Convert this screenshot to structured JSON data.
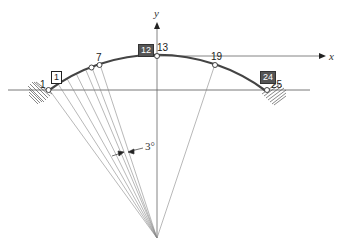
{
  "diagram": {
    "axes": {
      "x_label": "x",
      "y_label": "y"
    },
    "node_labels": {
      "n1": "1",
      "n7": "7",
      "n13": "13",
      "n19": "19",
      "n25": "25"
    },
    "element_labels": {
      "e1": "1",
      "e12": "12",
      "e24": "24"
    },
    "angle_label": "3°",
    "colors": {
      "line": "#333333",
      "arc": "#444444",
      "fan": "#888888",
      "hatch": "#555555",
      "node_fill": "#ffffff"
    },
    "geometry": {
      "center": [
        157,
        238
      ],
      "radius": 182,
      "half_angle_deg": 36,
      "element_angle_deg": 3,
      "num_elements": 24
    }
  }
}
